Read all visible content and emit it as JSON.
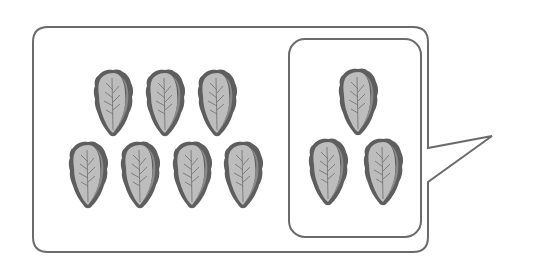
{
  "figure": {
    "object_icon": "lettuce-icon",
    "colors": {
      "stroke": "#6b6b6b",
      "leaf_outline": "#5e5e5e",
      "leaf_fill": "#bdbdbd",
      "leaf_shade": "#8a8a8a",
      "background": "#ffffff"
    },
    "groups": [
      {
        "name": "left-group",
        "count": 7,
        "items": [
          {
            "x": 92,
            "y": 68
          },
          {
            "x": 144,
            "y": 68
          },
          {
            "x": 196,
            "y": 68
          },
          {
            "x": 67,
            "y": 140
          },
          {
            "x": 119,
            "y": 140
          },
          {
            "x": 171,
            "y": 140
          },
          {
            "x": 222,
            "y": 140
          }
        ]
      },
      {
        "name": "boxed-group",
        "count": 3,
        "items": [
          {
            "x": 337,
            "y": 67
          },
          {
            "x": 307,
            "y": 137
          },
          {
            "x": 362,
            "y": 137
          }
        ]
      }
    ]
  }
}
